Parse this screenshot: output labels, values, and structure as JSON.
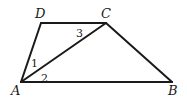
{
  "diagram": {
    "type": "trapezoid",
    "background": "#ffffff",
    "stroke_color": "#1a1a1a",
    "vertices": {
      "A": {
        "label": "A",
        "x": 21,
        "y": 82,
        "label_x": 11,
        "label_y": 95
      },
      "B": {
        "label": "B",
        "x": 172,
        "y": 82,
        "label_x": 168,
        "label_y": 95
      },
      "C": {
        "label": "C",
        "x": 106,
        "y": 23,
        "label_x": 101,
        "label_y": 18
      },
      "D": {
        "label": "D",
        "x": 41,
        "y": 23,
        "label_x": 35,
        "label_y": 18
      }
    },
    "segments": [
      {
        "name": "AB",
        "from": "A",
        "to": "B"
      },
      {
        "name": "BC",
        "from": "B",
        "to": "C"
      },
      {
        "name": "CD",
        "from": "C",
        "to": "D"
      },
      {
        "name": "DA",
        "from": "D",
        "to": "A"
      },
      {
        "name": "AC",
        "from": "A",
        "to": "C",
        "kind": "diagonal"
      }
    ],
    "angle_labels": [
      {
        "label": "1",
        "x": 31,
        "y": 67
      },
      {
        "label": "2",
        "x": 41,
        "y": 82
      },
      {
        "label": "3",
        "x": 76,
        "y": 37
      }
    ]
  }
}
